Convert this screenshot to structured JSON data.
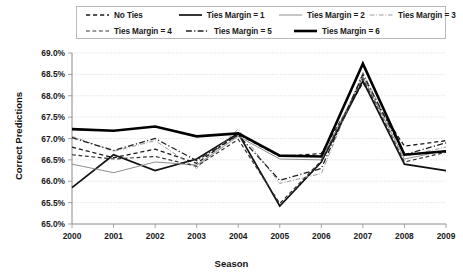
{
  "chart_data": {
    "type": "line",
    "title": "",
    "xlabel": "Season",
    "ylabel": "Correct Predictions",
    "x": [
      2000,
      2001,
      2002,
      2003,
      2004,
      2005,
      2006,
      2007,
      2008,
      2009
    ],
    "categories": [
      "2000",
      "2001",
      "2002",
      "2003",
      "2004",
      "2005",
      "2006",
      "2007",
      "2008",
      "2009"
    ],
    "ytick_labels": [
      "65.0%",
      "65.5%",
      "66.0%",
      "66.5%",
      "67.0%",
      "67.5%",
      "68.0%",
      "68.5%",
      "69.0%"
    ],
    "ytick_values": [
      65.0,
      65.5,
      66.0,
      66.5,
      67.0,
      67.5,
      68.0,
      68.5,
      69.0
    ],
    "ylim": [
      65.0,
      69.0
    ],
    "grid": true,
    "legend_position": "top",
    "series": [
      {
        "name": "No Ties",
        "style": "dashed",
        "color": "#1a1a1a",
        "width": 1.3,
        "values": [
          66.8,
          66.55,
          66.75,
          66.42,
          67.1,
          66.58,
          66.65,
          68.3,
          66.82,
          66.95
        ]
      },
      {
        "name": "Ties Margin = 1",
        "style": "solid",
        "color": "#111111",
        "width": 1.7,
        "values": [
          65.85,
          66.62,
          66.25,
          66.52,
          67.12,
          65.42,
          66.45,
          68.35,
          66.4,
          66.25
        ]
      },
      {
        "name": "Ties Margin = 2",
        "style": "solid",
        "color": "#8d8d8d",
        "width": 1.0,
        "values": [
          66.4,
          66.2,
          66.45,
          66.38,
          67.05,
          66.52,
          66.5,
          68.45,
          66.52,
          66.72
        ]
      },
      {
        "name": "Ties Margin = 3",
        "style": "dashdot",
        "color": "#9a9a9a",
        "width": 1.0,
        "values": [
          67.05,
          66.7,
          66.95,
          66.3,
          67.22,
          65.95,
          66.18,
          68.55,
          66.58,
          66.8
        ]
      },
      {
        "name": "Ties Margin = 4",
        "style": "dashed",
        "color": "#333333",
        "width": 1.2,
        "values": [
          66.62,
          66.52,
          66.58,
          66.35,
          66.98,
          65.48,
          66.48,
          68.4,
          66.45,
          66.68
        ]
      },
      {
        "name": "Ties Margin = 5",
        "style": "dashdot",
        "color": "#1f1f1f",
        "width": 1.3,
        "values": [
          67.02,
          66.72,
          67.0,
          66.48,
          67.08,
          66.02,
          66.3,
          68.5,
          66.62,
          66.9
        ]
      },
      {
        "name": "Ties Margin = 6",
        "style": "solid",
        "color": "#000000",
        "width": 2.6,
        "values": [
          67.22,
          67.18,
          67.28,
          67.05,
          67.12,
          66.6,
          66.58,
          68.75,
          66.62,
          66.7
        ]
      }
    ]
  },
  "legend": {
    "rows": [
      [
        "No Ties",
        "Ties Margin = 1",
        "Ties Margin = 2",
        "Ties Margin = 3"
      ],
      [
        "Ties Margin = 4",
        "Ties Margin = 5",
        "Ties Margin = 6"
      ]
    ]
  }
}
